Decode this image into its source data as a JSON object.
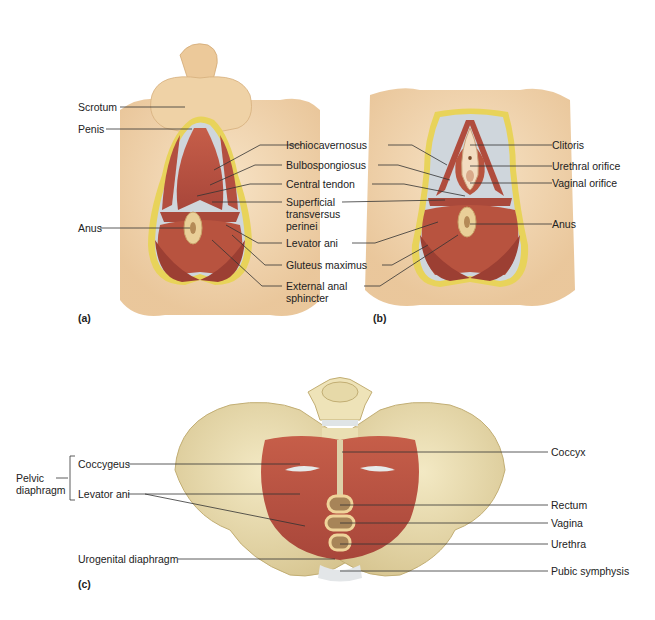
{
  "figure": {
    "panels": [
      {
        "id": "a",
        "panel_label": "(a)",
        "labels_left": [
          "Scrotum",
          "Penis",
          "Anus"
        ],
        "labels_center": [
          "Ischiocavernosus",
          "Bulbospongiosus",
          "Central tendon",
          "Superficial\ntransversus\nperinei",
          "Levator ani",
          "Gluteus maximus",
          "External anal\nsphincter"
        ]
      },
      {
        "id": "b",
        "panel_label": "(b)",
        "labels_right": [
          "Clitoris",
          "Urethral orifice",
          "Vaginal orifice",
          "Anus"
        ]
      },
      {
        "id": "c",
        "panel_label": "(c)",
        "group_label": "Pelvic\ndiaphragm",
        "labels_left": [
          "Coccygeus",
          "Levator ani",
          "Urogenital diaphragm"
        ],
        "labels_right": [
          "Coccyx",
          "Rectum",
          "Vagina",
          "Urethra",
          "Pubic symphysis"
        ]
      }
    ],
    "colors": {
      "skin": "#f1d3a8",
      "skin_shadow": "#e3b883",
      "fat_border": "#e8d35a",
      "muscle": "#b9503f",
      "muscle_dark": "#8e3428",
      "bone": "#e9dcae",
      "bone_shadow": "#cdbb84",
      "membrane": "#cfd6dc",
      "leader_line": "#333333"
    }
  }
}
